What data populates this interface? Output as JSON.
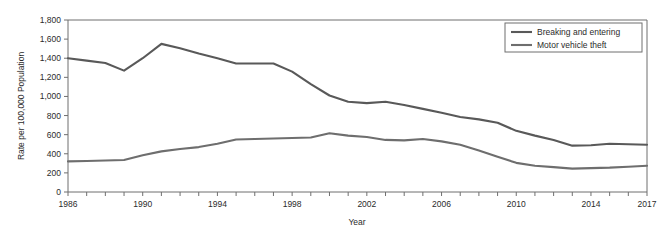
{
  "chart_data": {
    "type": "line",
    "title": "",
    "xlabel": "Year",
    "ylabel": "Rate per 100,000 Population",
    "xlim": [
      1986,
      2017
    ],
    "ylim": [
      0,
      1800
    ],
    "ytick_step": 200,
    "grid": false,
    "legend_position": "top-right",
    "x": [
      1986,
      1987,
      1988,
      1989,
      1990,
      1991,
      1992,
      1993,
      1994,
      1995,
      1996,
      1997,
      1998,
      1999,
      2000,
      2001,
      2002,
      2003,
      2004,
      2005,
      2006,
      2007,
      2008,
      2009,
      2010,
      2011,
      2012,
      2013,
      2014,
      2015,
      2016,
      2017
    ],
    "x_tick_labels": [
      "1986",
      "1990",
      "1994",
      "1998",
      "2002",
      "2006",
      "2010",
      "2014",
      "2017"
    ],
    "x_tick_label_values": [
      1986,
      1990,
      1994,
      1998,
      2002,
      2006,
      2010,
      2014,
      2017
    ],
    "y_tick_labels": [
      "0",
      "200",
      "400",
      "600",
      "800",
      "1,000",
      "1,200",
      "1,400",
      "1,600",
      "1,800"
    ],
    "y_tick_values": [
      0,
      200,
      400,
      600,
      800,
      1000,
      1200,
      1400,
      1600,
      1800
    ],
    "series": [
      {
        "name": "Breaking and entering",
        "color": "#595959",
        "values": [
          1400,
          1375,
          1350,
          1270,
          1400,
          1550,
          1505,
          1450,
          1400,
          1345,
          1345,
          1345,
          1260,
          1130,
          1010,
          945,
          930,
          945,
          910,
          870,
          830,
          785,
          760,
          725,
          640,
          590,
          545,
          485,
          490,
          505,
          500,
          495
        ]
      },
      {
        "name": "Motor vehicle theft",
        "color": "#6e6e6e",
        "values": [
          320,
          325,
          330,
          335,
          385,
          425,
          450,
          470,
          505,
          550,
          555,
          560,
          565,
          570,
          615,
          590,
          575,
          545,
          540,
          555,
          530,
          495,
          435,
          370,
          305,
          275,
          260,
          245,
          250,
          255,
          265,
          275
        ]
      }
    ]
  },
  "legend": {
    "entries": [
      {
        "label": "Breaking and entering"
      },
      {
        "label": "Motor vehicle theft"
      }
    ]
  },
  "axes": {
    "y_title": "Rate per 100,000 Population",
    "x_title": "Year"
  }
}
